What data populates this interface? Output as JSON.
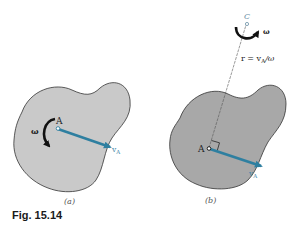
{
  "figure": {
    "caption": "Fig. 15.14",
    "panels": [
      {
        "id": "a",
        "label": "(a)",
        "point_label": "A",
        "omega_label": "ω",
        "velocity_label": "v",
        "velocity_subscript": "A",
        "body_fill": "#c9c9c9"
      },
      {
        "id": "b",
        "label": "(b)",
        "point_label": "A",
        "center_label": "C",
        "omega_label": "ω",
        "velocity_label": "v",
        "velocity_subscript": "A",
        "radius_equation": "r = v",
        "radius_equation_subscript": "A",
        "radius_equation_tail": "/ω",
        "body_fill": "#a8a8a8"
      }
    ],
    "colors": {
      "outline": "#333333",
      "vector": "#2e7fa0",
      "text": "#222222",
      "label_blue": "#3d86a8",
      "light_text": "#6a8fa5"
    }
  }
}
